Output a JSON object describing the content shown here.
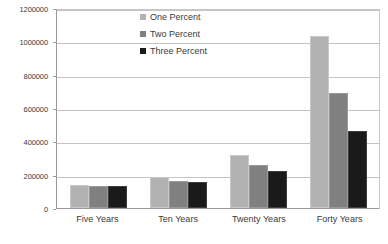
{
  "chart_data": {
    "type": "bar",
    "title": "",
    "subtitle": "",
    "xlabel": "",
    "ylabel": "",
    "categories": [
      "Five Years",
      "Ten Years",
      "Twenty Years",
      "Forty Years"
    ],
    "series": [
      {
        "name": "One Percent",
        "color": "#b2b2b2",
        "values": [
          140000,
          185000,
          320000,
          1030000
        ]
      },
      {
        "name": "Two Percent",
        "color": "#808080",
        "values": [
          135000,
          165000,
          260000,
          690000
        ]
      },
      {
        "name": "Three Percent",
        "color": "#1a1a1a",
        "values": [
          132000,
          155000,
          220000,
          460000
        ]
      }
    ],
    "ylim": [
      0,
      1200000
    ],
    "ytick_values": [
      0,
      200000,
      400000,
      600000,
      800000,
      1000000,
      1200000
    ],
    "ytick_labels": [
      "0",
      "200000",
      "400000",
      "600000",
      "800000",
      "1000000",
      "1200000"
    ],
    "grid": true,
    "grid_axis": "y",
    "legend_position": "top-center",
    "background_color": "#ffffff",
    "grid_color": "#c4c4c4",
    "axis_color": "#9a9a9a",
    "text_color": "#3a3a3a"
  }
}
